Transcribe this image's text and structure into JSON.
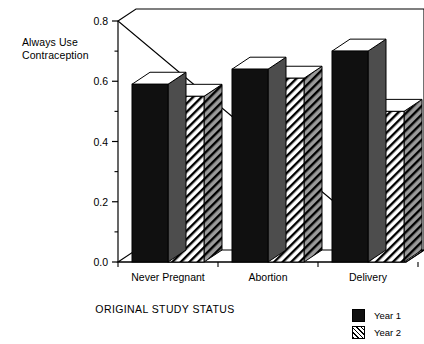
{
  "chart_data": {
    "type": "bar",
    "title": "",
    "subtitle": "",
    "xlabel": "ORIGINAL STUDY STATUS",
    "ylabel": "Always Use\nContraception",
    "categories": [
      "Never Pregnant",
      "Abortion",
      "Delivery"
    ],
    "series": [
      {
        "name": "Year 1",
        "values": [
          0.59,
          0.64,
          0.7
        ],
        "fill": "solid-black",
        "color": "#101010"
      },
      {
        "name": "Year 2",
        "values": [
          0.55,
          0.61,
          0.5
        ],
        "fill": "diagonal-hatch",
        "color": "#808080"
      }
    ],
    "ylim": [
      0.0,
      0.8
    ],
    "ytick_labels": [
      "0.8",
      "0.6",
      "0.4",
      "0.2",
      "0.0"
    ],
    "ytick_values": [
      0.8,
      0.6,
      0.4,
      0.2,
      0.0
    ],
    "yminor_values": [
      0.7,
      0.5,
      0.3,
      0.1
    ],
    "grid": false,
    "legend_position": "bottom-right",
    "style": "3d-extruded-bars",
    "axis_color": "#000000",
    "background": "#ffffff"
  },
  "legend": {
    "items": [
      {
        "label": "Year 1",
        "swatch": "solid-black-square"
      },
      {
        "label": "Year 2",
        "swatch": "hatched-square"
      }
    ]
  }
}
